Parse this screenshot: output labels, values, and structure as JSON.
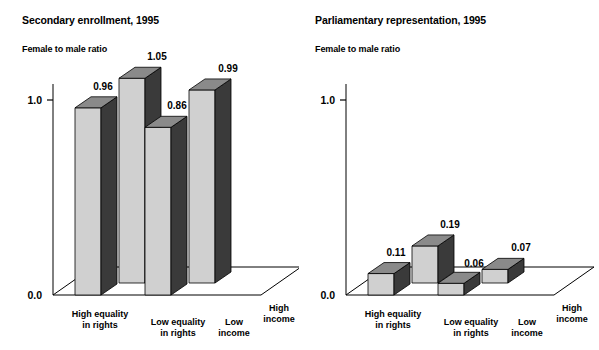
{
  "figure": {
    "background": "#ffffff",
    "width": 599,
    "height": 350
  },
  "panels": [
    {
      "id": "secondary-enrollment",
      "title": "Secondary enrollment, 1995",
      "subtitle": "Female to male ratio"
    },
    {
      "id": "parliamentary-representation",
      "title": "Parliamentary representation, 1995",
      "subtitle": "Female to male ratio"
    }
  ],
  "axis": {
    "top_tick": "1.0",
    "bottom_tick": "0.0"
  },
  "category_labels": [
    {
      "line1": "High equality",
      "line2": "in rights"
    },
    {
      "line1": "Low equality",
      "line2": "in rights"
    },
    {
      "line1": "Low",
      "line2": "income"
    },
    {
      "line1": "High",
      "line2": "income"
    }
  ],
  "colors": {
    "bar_front": "#d0d0d0",
    "bar_side": "#3a3a3a",
    "bar_top": "#8a8a8a",
    "axis": "#000000",
    "text": "#000000"
  },
  "chart_data": [
    {
      "type": "bar",
      "title": "Secondary enrollment, 1995",
      "subtitle": "Female to male ratio",
      "ylabel": "Female to male ratio",
      "xlabel": "",
      "categories": [
        "High equality in rights",
        "Low equality in rights",
        "Low income",
        "High income"
      ],
      "values": [
        0.96,
        1.05,
        0.86,
        0.99
      ],
      "value_labels": [
        "0.96",
        "1.05",
        "0.86",
        "0.99"
      ],
      "ylim": [
        0.0,
        1.0
      ],
      "yticks": [
        0.0,
        1.0
      ],
      "ytick_labels": [
        "0.0",
        "1.0"
      ],
      "grid": false,
      "legend": false,
      "three_d": true
    },
    {
      "type": "bar",
      "title": "Parliamentary representation, 1995",
      "subtitle": "Female to male ratio",
      "ylabel": "Female to male ratio",
      "xlabel": "",
      "categories": [
        "High equality in rights",
        "Low equality in rights",
        "Low income",
        "High income"
      ],
      "values": [
        0.11,
        0.19,
        0.06,
        0.07
      ],
      "value_labels": [
        "0.11",
        "0.19",
        "0.06",
        "0.07"
      ],
      "ylim": [
        0.0,
        1.0
      ],
      "yticks": [
        0.0,
        1.0
      ],
      "ytick_labels": [
        "0.0",
        "1.0"
      ],
      "grid": false,
      "legend": false,
      "three_d": true
    }
  ]
}
